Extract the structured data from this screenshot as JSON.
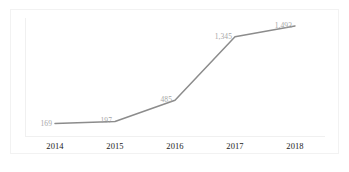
{
  "chart_data": {
    "type": "line",
    "title": "",
    "subtitle": "",
    "xlabel": "",
    "ylabel": "",
    "categories": [
      "2014",
      "2015",
      "2016",
      "2017",
      "2018"
    ],
    "values": [
      169,
      197,
      485,
      1345,
      1493
    ],
    "point_labels": [
      "169",
      "197",
      "485",
      "1,345",
      "1,493"
    ],
    "series": [
      {
        "name": "",
        "values": [
          169,
          197,
          485,
          1345,
          1493
        ]
      }
    ],
    "ylim": [
      0,
      1600
    ],
    "grid": false,
    "legend": false,
    "legend_position": "none",
    "annotations": [],
    "line_color": "#8c8c8c",
    "label_color": "#a6a6a6",
    "axis_label_color": "#1b1b1b",
    "background_color": "#ffffff",
    "border_color": "#f2f2f2"
  }
}
